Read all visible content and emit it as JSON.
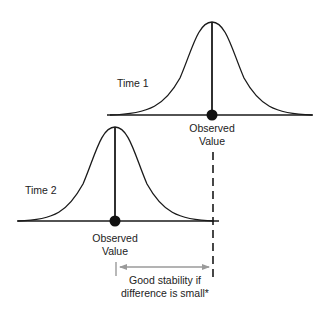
{
  "diagram": {
    "type": "test-retest-stability",
    "colors": {
      "curve": "#1a1a1a",
      "text": "#222222",
      "arrow": "#9a9a9a",
      "dashed": "#1a1a1a",
      "background": "#ffffff"
    },
    "time1": {
      "label": "Time 1",
      "observed_label_line1": "Observed",
      "observed_label_line2": "Value"
    },
    "time2": {
      "label": "Time 2",
      "observed_label_line1": "Observed",
      "observed_label_line2": "Value"
    },
    "annotation": {
      "line1": "Good stability if",
      "line2": "difference is small*"
    }
  }
}
